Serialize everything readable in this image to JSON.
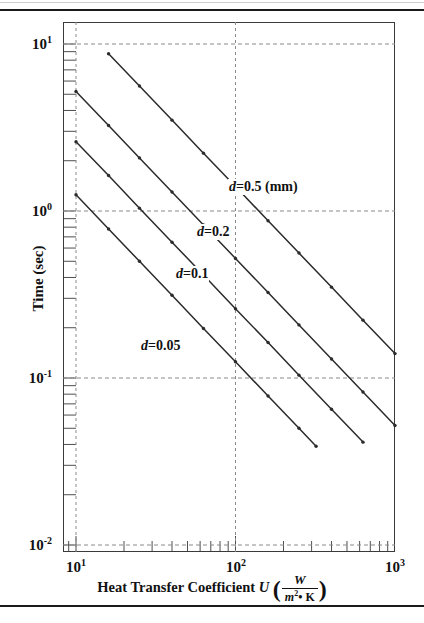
{
  "figure": {
    "top_rule": "horizontal-rule",
    "bottom_rule": "horizontal-rule"
  },
  "axes": {
    "y": {
      "label": "Time (sec)",
      "tick_labels": [
        {
          "mantissa": "10",
          "exponent": "1",
          "value": 10,
          "y_px": 44
        },
        {
          "mantissa": "10",
          "exponent": "0",
          "value": 1,
          "y_px": 211
        },
        {
          "mantissa": "10",
          "exponent": "-1",
          "value": 0.1,
          "y_px": 378
        },
        {
          "mantissa": "10",
          "exponent": "-2",
          "value": 0.01,
          "y_px": 545
        }
      ]
    },
    "x": {
      "label_text": "Heat Transfer Coefficient",
      "label_variable": "U",
      "unit_numerator": "W",
      "unit_denominator_base": "m",
      "unit_denominator_exponent": "2",
      "unit_denominator_tail": "• K",
      "tick_labels": [
        {
          "mantissa": "10",
          "exponent": "1",
          "value": 10,
          "x_px": 76
        },
        {
          "mantissa": "10",
          "exponent": "2",
          "value": 100,
          "x_px": 236
        },
        {
          "mantissa": "10",
          "exponent": "3",
          "value": 1000,
          "x_px": 395
        }
      ]
    }
  },
  "annotations": [
    {
      "name": "curve-label-d05",
      "prefix": "d",
      "text": "=0.5 (mm)",
      "x_px": 228,
      "y_px": 188
    },
    {
      "name": "curve-label-d02",
      "prefix": "d",
      "text": "=0.2",
      "x_px": 196,
      "y_px": 233
    },
    {
      "name": "curve-label-d01",
      "prefix": "d",
      "text": "=0.1",
      "x_px": 175,
      "y_px": 275
    },
    {
      "name": "curve-label-d005",
      "prefix": "d",
      "text": "=0.05",
      "x_px": 140,
      "y_px": 347
    }
  ],
  "chart_data": {
    "type": "line",
    "title": "",
    "xlabel": "Heat Transfer Coefficient U (W/m^2 • K)",
    "ylabel": "Time (sec)",
    "xscale": "log",
    "yscale": "log",
    "xlim": [
      10,
      1000
    ],
    "ylim": [
      0.01,
      100
    ],
    "grid": true,
    "grid_style": "dashed-major",
    "legend": "inline-annotations",
    "x_tick_values": [
      10,
      100,
      1000
    ],
    "y_tick_values": [
      0.01,
      0.1,
      1,
      10
    ],
    "marker": "small filled dot",
    "series": [
      {
        "name": "d=0.5 (mm)",
        "label": "d=0.5 (mm)",
        "x": [
          10,
          16,
          25,
          40,
          63,
          100,
          160,
          250,
          400,
          630,
          1000
        ],
        "y": [
          14.0,
          8.75,
          5.6,
          3.5,
          2.22,
          1.4,
          0.875,
          0.56,
          0.35,
          0.222,
          0.14
        ]
      },
      {
        "name": "d=0.2",
        "label": "d=0.2",
        "x": [
          10,
          16,
          25,
          40,
          63,
          100,
          160,
          250,
          400,
          630,
          1000
        ],
        "y": [
          5.2,
          3.25,
          2.08,
          1.3,
          0.825,
          0.52,
          0.325,
          0.208,
          0.13,
          0.0825,
          0.052
        ]
      },
      {
        "name": "d=0.1",
        "label": "d=0.1",
        "x": [
          10,
          16,
          25,
          40,
          63,
          100,
          160,
          250,
          400,
          630
        ],
        "y": [
          2.6,
          1.63,
          1.04,
          0.65,
          0.413,
          0.26,
          0.163,
          0.104,
          0.065,
          0.0413
        ]
      },
      {
        "name": "d=0.05",
        "label": "d=0.05",
        "x": [
          10,
          16,
          25,
          40,
          63,
          100,
          160,
          250,
          320
        ],
        "y": [
          1.25,
          0.78,
          0.5,
          0.313,
          0.198,
          0.125,
          0.078,
          0.05,
          0.039
        ]
      }
    ]
  },
  "colors": {
    "frame": "#3a3a3a",
    "curve": "#2b2b2b",
    "grid": "#8a8a8a",
    "text": "#111111",
    "rule": "#1a1a1a"
  }
}
